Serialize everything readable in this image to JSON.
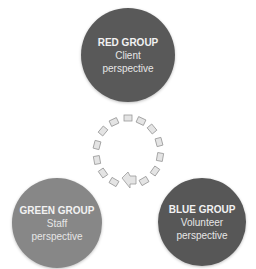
{
  "diagram": {
    "nodes": [
      {
        "id": "red",
        "title": "RED GROUP",
        "line1": "Client",
        "line2": "perspective",
        "color": "#595959"
      },
      {
        "id": "green",
        "title": "GREEN GROUP",
        "line1": "Staff",
        "line2": "perspective",
        "color": "#878787"
      },
      {
        "id": "blue",
        "title": "BLUE GROUP",
        "line1": "Volunteer",
        "line2": "perspective",
        "color": "#575757"
      }
    ],
    "center_icon": "circular-arrow-cycle-icon"
  }
}
